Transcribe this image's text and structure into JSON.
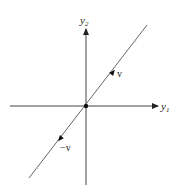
{
  "diagram": {
    "axes": {
      "x_label": "y",
      "x_label_sub": "1",
      "y_label": "y",
      "y_label_sub": "2"
    },
    "vectors": [
      {
        "label": "v",
        "direction": "outward along line toward upper-right"
      },
      {
        "label": "−v",
        "direction": "outward along line toward lower-left"
      }
    ],
    "origin_marker": "filled-dot",
    "colors": {
      "axis": "#333333",
      "line": "#555555",
      "faint_marker": "#bbbbbb"
    }
  }
}
